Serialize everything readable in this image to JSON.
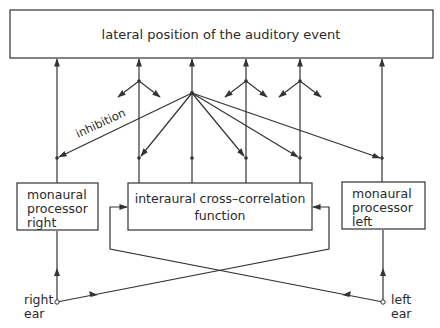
{
  "diagram": {
    "title_box": {
      "label": "lateral position of the auditory event"
    },
    "boxes": {
      "monaural_right": {
        "lines": [
          "monaural",
          "processor",
          "right"
        ]
      },
      "cross_correlation": {
        "lines": [
          "interaural cross–correlation",
          "function"
        ]
      },
      "monaural_left": {
        "lines": [
          "monaural",
          "processor",
          "left"
        ]
      }
    },
    "inhibition_label": "inhibition",
    "inputs": {
      "right_ear": {
        "lines": [
          "right",
          "ear"
        ]
      },
      "left_ear": {
        "lines": [
          "left",
          "ear"
        ]
      }
    },
    "colors": {
      "line": "#333333",
      "text": "#2a2a2a",
      "background": "#ffffff"
    }
  }
}
